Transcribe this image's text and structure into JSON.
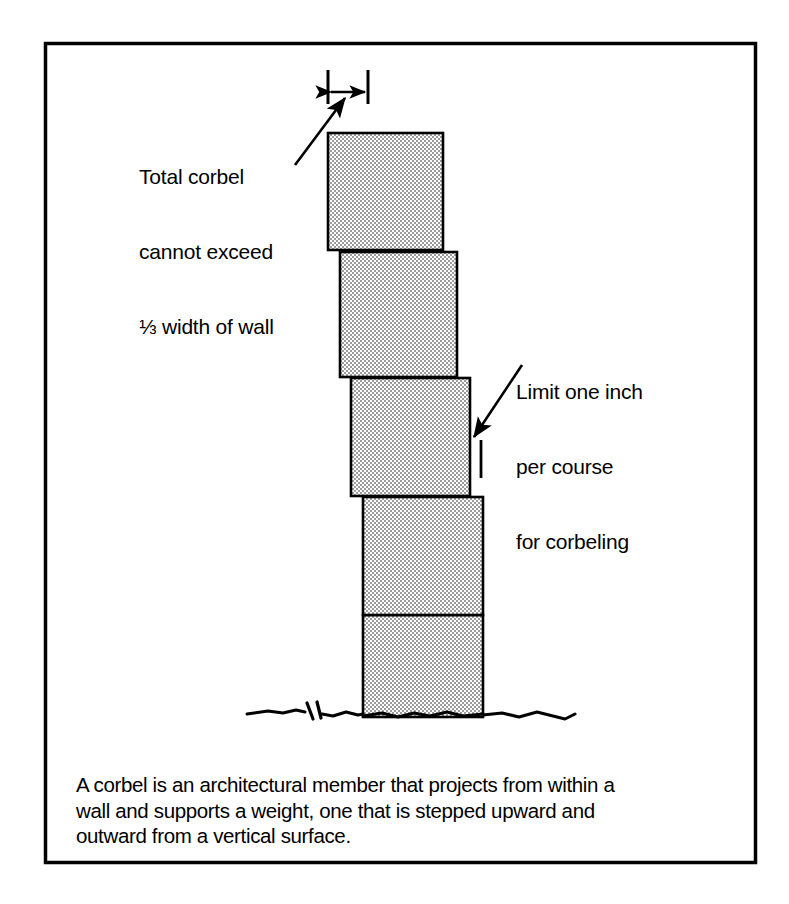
{
  "figure": {
    "border_color": "#000000",
    "background_color": "#ffffff",
    "masonry_fill": "#c9c9c9",
    "outline_color": "#000000",
    "annotations": {
      "top_left_note": {
        "name": "total-corbel-note",
        "lines": [
          "Total corbel",
          "cannot exceed",
          "⅓ width of wall"
        ]
      },
      "right_note": {
        "name": "limit-one-inch-note",
        "lines": [
          "Limit one inch",
          "per course",
          "for corbeling"
        ]
      }
    },
    "caption": {
      "lines": [
        "A corbel is an architectural member that projects from within a",
        "wall and supports a weight, one that is stepped upward and",
        "outward from a vertical surface."
      ]
    },
    "dimension_marker": {
      "name": "corbel-total-width-dimension",
      "description": "double headed arrow with end ticks above the top course"
    },
    "course_tick": {
      "name": "one-inch-course-tick",
      "description": "short vertical tick marking one inch projection"
    },
    "ground_line": {
      "name": "grade-line",
      "description": "irregular grade line with break symbol"
    },
    "courses": [
      {
        "name": "course-top",
        "label": "Top corbel course"
      },
      {
        "name": "course-second",
        "label": "Second corbel course"
      },
      {
        "name": "course-third",
        "label": "Third corbel course"
      },
      {
        "name": "course-fourth",
        "label": "Fourth corbel course"
      },
      {
        "name": "course-base",
        "label": "Base wall course"
      }
    ]
  }
}
